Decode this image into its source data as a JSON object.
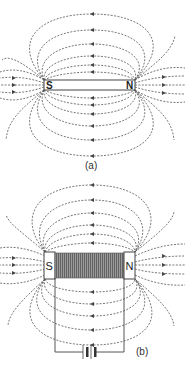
{
  "figure_a": {
    "caption": "(a)",
    "description": "Bar magnet magnetic field lines",
    "south_label": "S",
    "north_label": "N"
  },
  "figure_b": {
    "caption": "(b)",
    "description": "Electromagnet (solenoid with battery) magnetic field lines",
    "south_label": "S",
    "north_label": "N"
  },
  "colors": {
    "line": "#555555",
    "coil": "#777777",
    "background": "#ffffff"
  }
}
